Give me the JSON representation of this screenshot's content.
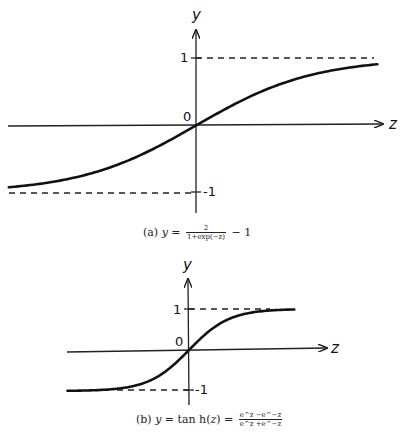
{
  "chart_data": [
    {
      "type": "line",
      "title": "(a) y = 2/(1+exp(-z)) - 1",
      "xlabel": "z",
      "ylabel": "y",
      "function": "2/(1+exp(-z)) - 1",
      "x_range": [
        -3.2,
        3.1
      ],
      "ylim": [
        -1.3,
        1.4
      ],
      "asymptotes": [
        1,
        -1
      ],
      "y_ticks": [
        "1",
        "0",
        "-1"
      ],
      "grid": false,
      "legend": "none",
      "series": [
        {
          "name": "scaled sigmoid",
          "x": [
            -3.2,
            -2,
            -1,
            0,
            1,
            2,
            3.1
          ],
          "values": [
            -0.92,
            -0.76,
            -0.46,
            0,
            0.46,
            0.76,
            0.91
          ]
        }
      ]
    },
    {
      "type": "line",
      "title": "(b) y = tan h(z) = (e^z - e^-z)/(e^z + e^-z)",
      "xlabel": "z",
      "ylabel": "y",
      "function": "tanh(z)",
      "x_range": [
        -3,
        2.6
      ],
      "ylim": [
        -1.4,
        1.8
      ],
      "asymptotes": [
        1,
        -1
      ],
      "y_ticks": [
        "1",
        "0",
        "-1"
      ],
      "grid": false,
      "legend": "none",
      "series": [
        {
          "name": "tanh",
          "x": [
            -3,
            -2,
            -1,
            0,
            1,
            2,
            2.6
          ],
          "values": [
            -0.995,
            -0.96,
            -0.76,
            0,
            0.76,
            0.96,
            0.99
          ]
        }
      ]
    }
  ],
  "plot_a": {
    "y_label": "y",
    "z_label": "z",
    "tick_one": "1",
    "tick_zero": "0",
    "tick_minus_one": "-1",
    "caption": {
      "prefix": "(a) ",
      "lhs": "y",
      "eq": " = ",
      "num": "2",
      "den": "1+exp(−z)",
      "suffix": " − 1"
    }
  },
  "plot_b": {
    "y_label": "y",
    "z_label": "z",
    "tick_one": "1",
    "tick_zero": "0",
    "tick_minus_one": "-1",
    "caption": {
      "prefix": "(b) ",
      "lhs": "y",
      "mid": " = tan h(",
      "arg": "z",
      "close": ") = ",
      "num": "e^z −e^−z",
      "den": "e^z +e^−z"
    }
  },
  "colors": {
    "curve": "#111111",
    "axis": "#222222",
    "dash": "#222222"
  }
}
